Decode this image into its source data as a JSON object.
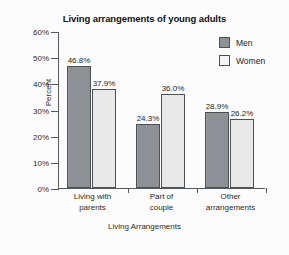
{
  "chart_data": {
    "type": "bar",
    "title": "Living arrangements of young adults",
    "xlabel": "Living Arrangements",
    "ylabel": "Percent",
    "ylim": [
      0,
      60
    ],
    "yticks": [
      0,
      10,
      20,
      30,
      40,
      50,
      60
    ],
    "ytick_labels": [
      "0%",
      "10%",
      "20%",
      "30%",
      "40%",
      "50%",
      "60%"
    ],
    "grid": false,
    "legend_position": "top-right",
    "categories": [
      "Living with parents",
      "Part of couple",
      "Other arrangements"
    ],
    "category_lines": [
      [
        "Living with",
        "parents"
      ],
      [
        "Part of",
        "couple"
      ],
      [
        "Other",
        "arrangements"
      ]
    ],
    "series": [
      {
        "name": "Men",
        "color": "#8d9094",
        "values": [
          46.8,
          24.3,
          28.9
        ],
        "labels": [
          "46.8%",
          "24.3%",
          "28.9%"
        ]
      },
      {
        "name": "Women",
        "color": "#e9e9e9",
        "values": [
          37.9,
          36.0,
          26.2
        ],
        "labels": [
          "37.9%",
          "36.0%",
          "26.2%"
        ]
      }
    ]
  },
  "legend": {
    "items": [
      {
        "label": "Men",
        "swatch": "men"
      },
      {
        "label": "Women",
        "swatch": "women"
      }
    ]
  }
}
